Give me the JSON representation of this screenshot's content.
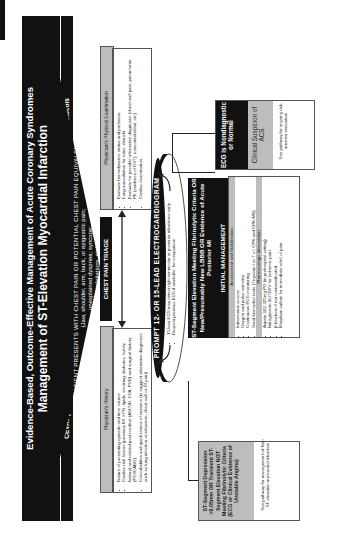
{
  "header": {
    "line1": "Evidence-Based, Outcome-Effective Management of Acute Coronary Syndromes",
    "line2": "Management of ST-Elevation Myocardial Infarction",
    "subtitle": "CEVAT (Centers of Excellence in Venous and Arterial Thrombosis) Leadership Council Guidelines and Protocols"
  },
  "presentation": {
    "line1": "PATIENT PRESENTS WITH CHEST PAIN OR POTENTIAL CHEST PAIN EQUIVALENT",
    "line2": "(Jaw, shoulder, arm, back, or epigastric pain;",
    "line3": "unexplained dyspnea; syncope;",
    "line4": "palpitations, etc)"
  },
  "triage": {
    "title": "CHEST PAIN TRIAGE",
    "history": {
      "heading": "Physician's History",
      "items": [
        "Nature of presenting episode and time course",
        "Cardiac risk factors (previous MI, HTN, lipids, smoking, diabetes, family history) and related past medical (ASCVD, CVA, PVD) and surgical history (PCI/CABG)",
        "Comorbidities and quick review of systems (to suggest alternative diagnoses such as lung infection or infarction, chest wall or GI pain)"
      ]
    },
    "exam": {
      "heading": "Physician's Physical Examination",
      "items": [
        "Evaluate hemodynamic status and perfusion",
        "Lung auscultation for rales, rhonchi",
        "Evaluate for possible alternative diagnoses (chest wall pain, pneumonia, PE (evidence of DVT), musculoskeletal, etc)",
        "Cardiac examination"
      ]
    }
  },
  "ecg": {
    "title": "PROMPT 12- OR 15-LEAD ELECTROCARDIOGRAM",
    "items": [
      "15-lead ECG may detect right ventricular or posterior infarctions early",
      "Request previous ECG if available, for comparison"
    ]
  },
  "depression": {
    "title": "ST-Segment Depression >0.05mm OR Transient ST-Segment Elevation NOT Meeting Fibrinolytic Criteria (ECG or Clinical Evidence of Unstable Angina)",
    "note": "See pathway for management of Non ST-elevation myocardial infarction"
  },
  "stemi": {
    "title": "ST-Segment Elevation Meeting Fibrinolytic Criteria OR New/Presumably New LBBB OR Evidence of Acute Posterior MI",
    "management_title": "INITIAL MANAGEMENT",
    "assessment_heading": "Assessment and Stabilization",
    "assessment_items": [
      "Intravenous access",
      "Oxygen and pulse oximetry",
      "Continuous ECG monitoring",
      "Send biomarker tests (Troponin I or T +/- CPK and CPK-MB)"
    ],
    "pharm_heading": "Pharmacologic Intervention",
    "pharm_items": [
      "Aspirin 162-325mg PO (in prehospital setting)",
      "Nitroglycerin SL/TD/IV for ischemic pain",
      "β-blockers if not contraindicated",
      "Morphine sulfate for immediate relief of pain"
    ]
  },
  "normal": {
    "title": "ECG is Nondiagnostic or Normal",
    "suspicion": "Clinical Suspicion of ACS",
    "note": "See pathway for ongoing risk-oriented evaluation"
  }
}
